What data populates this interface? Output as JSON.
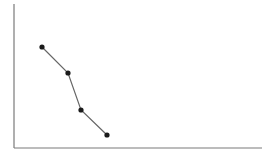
{
  "chart_data": {
    "type": "line",
    "title": "",
    "xlabel": "",
    "ylabel": "",
    "grid": false,
    "legend": null,
    "x": [
      1,
      2,
      3,
      4
    ],
    "series": [
      {
        "name": "series-1",
        "values": [
          4,
          3,
          1.5,
          0.5
        ]
      }
    ],
    "xlim": [
      -2,
      10
    ],
    "ylim": [
      -0.5,
      6
    ],
    "marker": "circle",
    "colors": {
      "axis": "#7a7a7a",
      "line": "#666666",
      "marker": "#1a1a1a",
      "background": "#ffffff"
    },
    "pixel_points": [
      [
        42,
        47
      ],
      [
        68,
        73
      ],
      [
        81,
        110
      ],
      [
        107,
        135
      ]
    ],
    "axes_box": {
      "x0": 14,
      "y0": 4,
      "x1": 262,
      "y1": 148
    }
  }
}
